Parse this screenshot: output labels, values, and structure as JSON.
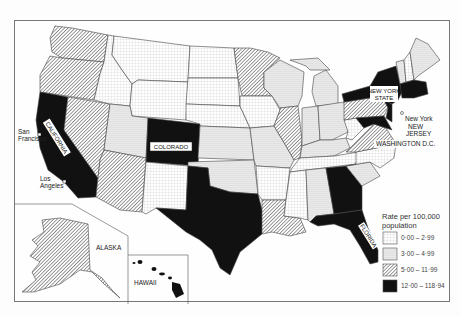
{
  "map": {
    "title": "Rate per 100,000 population",
    "colors": {
      "c1": "#ffffff",
      "c2": "#e6e6e6",
      "c3": "#9a9a9a",
      "c4": "#111111"
    },
    "labels": {
      "colorado": "COLORADO",
      "california": "CALIFORNIA",
      "florida": "FLORIDA",
      "new_york_state": "NEW YORK STATE",
      "new_york": "New York",
      "new_jersey": "NEW JERSEY",
      "washington_dc": "WASHINGTON D.C.",
      "san_francisco": "San Francisco",
      "los_angeles": "Los Angeles",
      "alaska": "ALASKA",
      "hawaii": "HAWAII"
    },
    "legend": {
      "title_line1": "Rate per 100,000",
      "title_line2": "population",
      "items": [
        {
          "range": "0·00 – 2·99",
          "class": "lowest"
        },
        {
          "range": "3·00 – 4·99",
          "class": "low"
        },
        {
          "range": "5·00 – 11·99",
          "class": "medium"
        },
        {
          "range": "12·00 – 118·94",
          "class": "highest"
        }
      ]
    },
    "state_classes": {
      "highest": [
        "California",
        "Colorado",
        "Texas",
        "Georgia",
        "Florida",
        "New York",
        "New Jersey",
        "Massachusetts",
        "Maryland",
        "Connecticut"
      ],
      "medium": [
        "Washington",
        "Oregon",
        "Nevada",
        "Arizona",
        "Minnesota",
        "Illinois",
        "Louisiana",
        "Pennsylvania",
        "Virginia",
        "Alaska"
      ],
      "low": [
        "Utah",
        "Michigan",
        "Indiana",
        "Ohio",
        "Missouri",
        "Kansas",
        "Oklahoma",
        "Alabama",
        "Vermont",
        "Maine",
        "Wisconsin",
        "Kentucky",
        "South Carolina"
      ],
      "lowest": [
        "Idaho",
        "Montana",
        "Wyoming",
        "North Dakota",
        "South Dakota",
        "Nebraska",
        "Iowa",
        "New Mexico",
        "Arkansas",
        "Mississippi",
        "Tennessee",
        "North Carolina",
        "New Hampshire",
        "West Virginia"
      ]
    }
  }
}
